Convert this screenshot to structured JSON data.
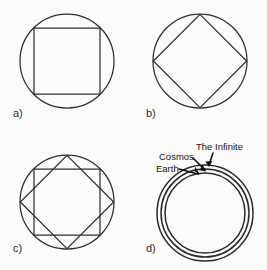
{
  "figure": {
    "background_color": "#fbfbfa",
    "stroke_color": "#2f2f2f",
    "text_color": "#141414",
    "width": 267,
    "height": 270
  },
  "panels": [
    {
      "id": "a",
      "label": "a)",
      "label_x": 13,
      "label_y": 117,
      "description": "Circle with an axis-aligned inscribed square",
      "circle": {
        "cx": 67,
        "cy": 61,
        "r": 47
      },
      "square": {
        "cx": 67,
        "cy": 61,
        "half": 33,
        "rotation": 0
      },
      "shapes": [
        "circle",
        "square-upright"
      ]
    },
    {
      "id": "b",
      "label": "b)",
      "label_x": 146,
      "label_y": 117,
      "description": "Circle with an inscribed square rotated 45 degrees (diamond)",
      "circle": {
        "cx": 200,
        "cy": 61,
        "r": 47
      },
      "square": {
        "cx": 200,
        "cy": 61,
        "half": 33,
        "rotation": 45
      },
      "shapes": [
        "circle",
        "square-rotated"
      ]
    },
    {
      "id": "c",
      "label": "c)",
      "label_x": 13,
      "label_y": 252,
      "description": "Circle with both squares superimposed forming an eight pointed star",
      "circle": {
        "cx": 67,
        "cy": 202,
        "r": 47
      },
      "square": {
        "cx": 67,
        "cy": 202,
        "half": 33,
        "rotation": 0
      },
      "square_rotated": {
        "cx": 67,
        "cy": 202,
        "half": 33,
        "rotation": 45
      },
      "shapes": [
        "circle",
        "square-upright",
        "square-rotated"
      ]
    },
    {
      "id": "d",
      "label": "d)",
      "label_x": 146,
      "label_y": 252,
      "description": "Three concentric circles labelled from inner to outer",
      "center": {
        "cx": 205,
        "cy": 213
      },
      "rings": [
        {
          "name": "Earth",
          "r": 40
        },
        {
          "name": "Cosmos",
          "r": 44
        },
        {
          "name": "The Infinite",
          "r": 48
        }
      ],
      "shapes": [
        "concentric-circles"
      ]
    }
  ],
  "callouts": [
    {
      "id": "infinite",
      "text": "The Infinite",
      "text_x": 196,
      "text_y": 150,
      "anchor": "start",
      "line": "M 213 153 L 209 165",
      "head": "M 209 167 l -3.6 -5.4 l 7.0 -0.6 z"
    },
    {
      "id": "cosmos",
      "text": "Cosmos",
      "text_x": 159,
      "text_y": 160,
      "anchor": "start",
      "line": "M 193 158 L 205 170",
      "head": "M 206 171.5 l -6.4 -1.2 l 3.0 -5.6 z"
    },
    {
      "id": "earth",
      "text": "Earth",
      "text_x": 156,
      "text_y": 172,
      "anchor": "start",
      "line": "M 179 169 L 198 174",
      "head": "M 200 174.6 l -5.4 -3.4 l 0.6 -4.4 z"
    }
  ]
}
